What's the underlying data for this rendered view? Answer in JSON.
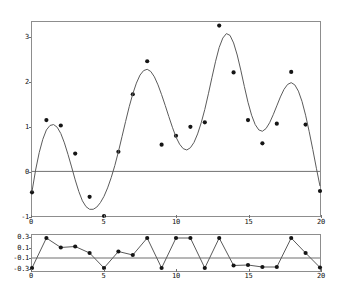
{
  "chart_data": [
    {
      "id": "main",
      "type": "scatter",
      "title": "",
      "xlabel": "",
      "ylabel": "",
      "xlim": [
        0,
        20
      ],
      "ylim": [
        -1.0,
        3.35
      ],
      "grid": false,
      "legend": null,
      "xticks": [
        0,
        5,
        10,
        15,
        20
      ],
      "xticklabels": [
        "0",
        "5",
        "10",
        "15",
        "20"
      ],
      "yticks": [
        -1,
        0,
        1,
        2,
        3
      ],
      "yticklabels": [
        "-1",
        "0",
        "1",
        "2",
        "3"
      ],
      "reference_lines": [
        {
          "axis": "y",
          "value": 0,
          "color": "#6f6f6f"
        }
      ],
      "series": [
        {
          "name": "data",
          "type": "scatter",
          "marker": "filled-circle",
          "color": "#151515",
          "x": [
            0,
            1,
            2,
            3,
            4,
            5,
            6,
            7,
            8,
            9,
            10,
            11,
            12,
            13,
            14,
            15,
            16,
            17,
            18,
            19,
            20
          ],
          "y": [
            -0.47,
            1.15,
            1.03,
            0.4,
            -0.57,
            -1.0,
            0.44,
            1.73,
            2.47,
            0.6,
            0.8,
            1.0,
            1.1,
            3.27,
            2.22,
            1.15,
            0.63,
            1.07,
            2.23,
            1.05,
            -0.44
          ]
        },
        {
          "name": "fit",
          "type": "line",
          "color": "#5a5a5a",
          "x": [
            0,
            0.25,
            0.5,
            0.75,
            1,
            1.25,
            1.5,
            1.75,
            2,
            2.25,
            2.5,
            2.75,
            3,
            3.25,
            3.5,
            3.75,
            4,
            4.25,
            4.5,
            4.75,
            5,
            5.25,
            5.5,
            5.75,
            6,
            6.25,
            6.5,
            6.75,
            7,
            7.25,
            7.5,
            7.75,
            8,
            8.25,
            8.5,
            8.75,
            9,
            9.25,
            9.5,
            9.75,
            10,
            10.25,
            10.5,
            10.75,
            11,
            11.25,
            11.5,
            11.75,
            12,
            12.25,
            12.5,
            12.75,
            13,
            13.25,
            13.5,
            13.75,
            14,
            14.25,
            14.5,
            14.75,
            15,
            15.25,
            15.5,
            15.75,
            16,
            16.25,
            16.5,
            16.75,
            17,
            17.25,
            17.5,
            17.75,
            18,
            18.25,
            18.5,
            18.75,
            19,
            19.25,
            19.5,
            19.75,
            20
          ],
          "y": [
            -0.45,
            0.03,
            0.42,
            0.72,
            0.93,
            1.03,
            1.05,
            0.99,
            0.85,
            0.64,
            0.38,
            0.1,
            -0.19,
            -0.45,
            -0.66,
            -0.79,
            -0.85,
            -0.85,
            -0.8,
            -0.7,
            -0.56,
            -0.37,
            -0.14,
            0.13,
            0.44,
            0.78,
            1.12,
            1.45,
            1.74,
            1.98,
            2.16,
            2.26,
            2.29,
            2.24,
            2.12,
            1.94,
            1.72,
            1.48,
            1.23,
            0.99,
            0.77,
            0.61,
            0.51,
            0.48,
            0.53,
            0.65,
            0.84,
            1.09,
            1.39,
            1.74,
            2.11,
            2.47,
            2.78,
            2.99,
            3.09,
            3.05,
            2.88,
            2.61,
            2.27,
            1.9,
            1.55,
            1.26,
            1.05,
            0.93,
            0.9,
            0.96,
            1.09,
            1.27,
            1.47,
            1.67,
            1.84,
            1.95,
            1.99,
            1.94,
            1.8,
            1.57,
            1.26,
            0.89,
            0.49,
            0.07,
            -0.33
          ]
        }
      ]
    },
    {
      "id": "residuals",
      "type": "line",
      "title": "",
      "xlabel": "",
      "ylabel": "",
      "xlim": [
        0,
        20
      ],
      "ylim": [
        -0.36,
        0.36
      ],
      "grid": false,
      "legend": null,
      "xticks": [
        0,
        5,
        10,
        15,
        20
      ],
      "xticklabels": [
        "0",
        "5",
        "10",
        "15",
        "20"
      ],
      "yticks": [
        0.3,
        0.1,
        -0.1,
        -0.3
      ],
      "yticklabels": [
        "0.3",
        "0.1",
        "-0.1",
        "-0.3"
      ],
      "reference_lines": [
        {
          "axis": "y",
          "value": -0.1,
          "color": "#6f6f6f"
        }
      ],
      "series": [
        {
          "name": "residual",
          "type": "line-markers",
          "marker": "filled-circle",
          "color": "#5a5a5a",
          "x": [
            0,
            1,
            2,
            3,
            4,
            5,
            6,
            7,
            8,
            9,
            10,
            11,
            12,
            13,
            14,
            15,
            16,
            17,
            18,
            19,
            20
          ],
          "y": [
            -0.3,
            0.3,
            0.11,
            0.13,
            0.0,
            -0.3,
            0.03,
            -0.04,
            0.3,
            -0.3,
            0.3,
            0.3,
            -0.3,
            0.3,
            -0.25,
            -0.24,
            -0.28,
            -0.28,
            0.3,
            0.0,
            -0.29
          ]
        }
      ]
    }
  ]
}
